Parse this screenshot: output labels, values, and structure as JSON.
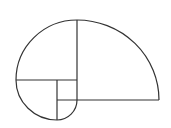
{
  "diagram": {
    "type": "golden-spiral",
    "stroke_color": "#333333",
    "background": "#ffffff",
    "arcs": [
      {
        "name": "arc-large",
        "d": "M 77 20 A 82 80 0 0 1 159 100"
      },
      {
        "name": "arc-left",
        "d": "M 16 80 A 61 60 0 0 1 77 20"
      },
      {
        "name": "arc-bottom-left",
        "d": "M 57 120 A 41 40 0 0 1 16 80"
      },
      {
        "name": "arc-small",
        "d": "M 77 100 A 20 20 0 0 1 57 120"
      }
    ],
    "lines": [
      {
        "name": "divider-vertical-main",
        "x1": 77,
        "y1": 20,
        "x2": 77,
        "y2": 100
      },
      {
        "name": "divider-horizontal-bottom",
        "x1": 57,
        "y1": 100,
        "x2": 159,
        "y2": 100
      },
      {
        "name": "divider-horizontal-left",
        "x1": 16,
        "y1": 80,
        "x2": 77,
        "y2": 80
      },
      {
        "name": "divider-vertical-small",
        "x1": 57,
        "y1": 80,
        "x2": 57,
        "y2": 120
      }
    ]
  }
}
